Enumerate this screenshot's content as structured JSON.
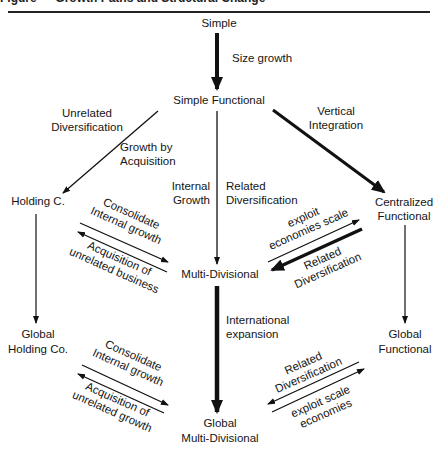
{
  "figure": {
    "title_clipped": "Figure — Growth Paths and Structural Change"
  },
  "nodes": {
    "simple": "Simple",
    "simple_functional": "Simple Functional",
    "holding": "Holding C.",
    "multi_divisional": "Multi-Divisional",
    "centralized_functional": [
      "Centralized",
      "Functional"
    ],
    "global_holding": [
      "Global",
      "Holding Co."
    ],
    "global_multi_divisional": [
      "Global",
      "Multi-Divisional"
    ],
    "global_functional": [
      "Global",
      "Functional"
    ]
  },
  "edges": {
    "size_growth": "Size growth",
    "unrelated_diversification": [
      "Unrelated",
      "Diversification"
    ],
    "growth_by_acquisition": [
      "Growth by",
      "Acquisition"
    ],
    "internal_growth": [
      "Internal",
      "Growth"
    ],
    "related_diversification_center": [
      "Related",
      "Diversification"
    ],
    "vertical_integration": [
      "Vertical",
      "Integration"
    ],
    "consolidate_internal_growth_upper": [
      "Consolidate",
      "Internal growth"
    ],
    "acquisition_unrelated_business": [
      "Acquisition of",
      "unrelated business"
    ],
    "exploit_economies_scale": [
      "exploit",
      "economies scale"
    ],
    "related_diversification_right": [
      "Related",
      "Diversification"
    ],
    "international_expansion": [
      "International",
      "expansion"
    ],
    "consolidate_internal_growth_lower": [
      "Consolidate",
      "Internal growth"
    ],
    "acquisition_unrelated_growth": [
      "Acquisition of",
      "unrelated growth"
    ],
    "related_diversification_lower_right": [
      "Related",
      "Diversification"
    ],
    "exploit_scale_economies": [
      "exploit scale",
      "economies"
    ]
  }
}
